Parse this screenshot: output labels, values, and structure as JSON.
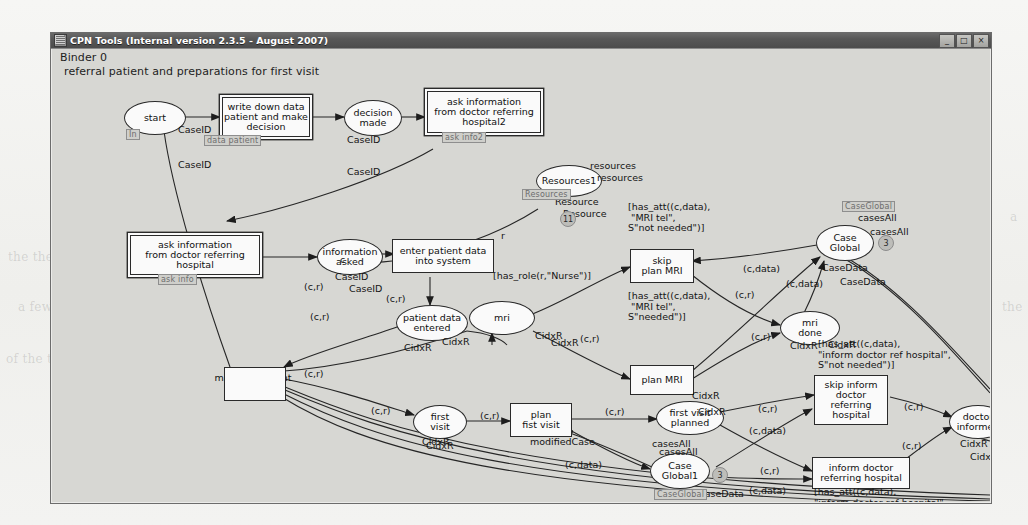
{
  "window": {
    "title": "CPN Tools (Internal version 2.3.5 - August 2007)",
    "icon": "cpn-app-icon",
    "buttons": {
      "minimize": "_",
      "maximize": "□",
      "close": "×"
    }
  },
  "canvas": {
    "binder_label": "Binder 0",
    "page_subtitle": "referral patient and preparations for first visit"
  },
  "ghost_text": [
    {
      "text": "the the and",
      "x": 8,
      "y": 250
    },
    {
      "text": "a few words",
      "x": 18,
      "y": 300
    },
    {
      "text": "of the to",
      "x": 6,
      "y": 352
    },
    {
      "text": "it is a and the in of it to a",
      "x": 130,
      "y": 466
    },
    {
      "text": "the and a to",
      "x": 470,
      "y": 468
    },
    {
      "text": "and the of a to in",
      "x": 700,
      "y": 470
    },
    {
      "text": "the",
      "x": 1002,
      "y": 300
    },
    {
      "text": "a",
      "x": 1010,
      "y": 210
    }
  ],
  "places": [
    {
      "id": "start",
      "label": "start",
      "type": "CaseID",
      "port": "In",
      "fusion": "",
      "marking": ""
    },
    {
      "id": "decision_made",
      "label": "decision\nmade",
      "type": "CaseID",
      "port": "",
      "fusion": "",
      "marking": ""
    },
    {
      "id": "information_asked",
      "label": "information\nasked",
      "type": "CaseID",
      "port": "",
      "fusion": "",
      "marking": ""
    },
    {
      "id": "patient_data",
      "label": "patient data\nentered",
      "type": "CidxR",
      "port": "",
      "fusion": "",
      "marking": ""
    },
    {
      "id": "resources1",
      "label": "Resources1",
      "type": "Resource",
      "port": "",
      "fusion": "Resources",
      "marking": "11",
      "name_label": "resources"
    },
    {
      "id": "mri",
      "label": "mri",
      "type": "CidxR",
      "port": "",
      "fusion": "",
      "marking": ""
    },
    {
      "id": "mri_done",
      "label": "mri\ndone",
      "type": "CidxR",
      "port": "",
      "fusion": "",
      "marking": ""
    },
    {
      "id": "case_global",
      "label": "Case\nGlobal",
      "type": "CaseData",
      "port": "",
      "fusion": "CaseGlobal",
      "marking": "3",
      "name_label": "casesAll"
    },
    {
      "id": "first_visit",
      "label": "first\nvisit",
      "type": "CidxR",
      "port": "",
      "fusion": "",
      "marking": ""
    },
    {
      "id": "first_visit_planned",
      "label": "first visit\nplanned",
      "type": "CidxR",
      "port": "",
      "fusion": "",
      "marking": ""
    },
    {
      "id": "case_global1",
      "label": "Case\nGlobal1",
      "type": "CaseData",
      "port": "",
      "fusion": "CaseGlobal",
      "marking": "3",
      "name_label": "casesAll"
    },
    {
      "id": "doctor_informed",
      "label": "doctor\ninformed",
      "type": "CidxR",
      "port": "",
      "fusion": "",
      "marking": ""
    }
  ],
  "transitions": [
    {
      "id": "write_down",
      "label": "write down data\npatient and make\ndecision",
      "tag": "data patient",
      "guard": ""
    },
    {
      "id": "ask_info2",
      "label": "ask information\nfrom doctor referring\nhospital2",
      "tag": "ask info2",
      "guard": ""
    },
    {
      "id": "ask_info",
      "label": "ask information\nfrom doctor referring\nhospital",
      "tag": "ask info",
      "guard": ""
    },
    {
      "id": "enter_patient",
      "label": "enter patient data\ninto system",
      "tag": "",
      "guard": "[has_role(r,\"Nurse\")]"
    },
    {
      "id": "skip_plan_mri",
      "label": "skip\nplan MRI",
      "tag": "",
      "guard": "[has_att((c,data),\n \"MRI tel\",\nS\"not needed\")]"
    },
    {
      "id": "plan_mri",
      "label": "plan MRI",
      "tag": "",
      "guard": "[has_att((c,data),\n \"MRI tel\",\nS\"needed\")]"
    },
    {
      "id": "make_document",
      "label": "make document\nand stickers",
      "tag": "",
      "guard": ""
    },
    {
      "id": "plan_fist_visit",
      "label": "plan\nfist visit",
      "tag": "",
      "guard": ""
    },
    {
      "id": "skip_inform",
      "label": "skip inform\ndoctor\nreferring\nhospital",
      "tag": "",
      "guard": "[has_att((c,data),\n\"inform doctor ref hospital\",\nS\"not needed\")]"
    },
    {
      "id": "inform_doctor",
      "label": "inform doctor\nreferring hospital",
      "tag": "",
      "guard": "[has_att((c,data),\n\"inform doctor ref hospital\",\nS\"needed\")]"
    }
  ],
  "arc_inscriptions": [
    {
      "text": "CaseID",
      "x": 126,
      "y": 111
    },
    {
      "text": "CaseID",
      "x": 295,
      "y": 118
    },
    {
      "text": "CaseID",
      "x": 297,
      "y": 235
    },
    {
      "text": "c",
      "x": 288,
      "y": 206
    },
    {
      "text": "(c,r)",
      "x": 334,
      "y": 245
    },
    {
      "text": "(c,r)",
      "x": 252,
      "y": 233
    },
    {
      "text": "r",
      "x": 449,
      "y": 182
    },
    {
      "text": "resources",
      "x": 545,
      "y": 124
    },
    {
      "text": "Resource",
      "x": 511,
      "y": 160
    },
    {
      "text": "CidxR",
      "x": 352,
      "y": 294
    },
    {
      "text": "CidxR",
      "x": 499,
      "y": 289
    },
    {
      "text": "(c,r)",
      "x": 528,
      "y": 285
    },
    {
      "text": "(c,r)",
      "x": 683,
      "y": 241
    },
    {
      "text": "(c,r)",
      "x": 699,
      "y": 283
    },
    {
      "text": "(c,data)",
      "x": 691,
      "y": 215
    },
    {
      "text": "(c,data)",
      "x": 734,
      "y": 230
    },
    {
      "text": "casesAll",
      "x": 818,
      "y": 178
    },
    {
      "text": "CaseData",
      "x": 788,
      "y": 228
    },
    {
      "text": "CidxR",
      "x": 776,
      "y": 291
    },
    {
      "text": "(c,r)",
      "x": 258,
      "y": 263
    },
    {
      "text": "(c,r)",
      "x": 252,
      "y": 320
    },
    {
      "text": "(c,r)",
      "x": 319,
      "y": 357
    },
    {
      "text": "(c,r)",
      "x": 428,
      "y": 362
    },
    {
      "text": "CidxR",
      "x": 374,
      "y": 392
    },
    {
      "text": "(c,r)",
      "x": 553,
      "y": 358
    },
    {
      "text": "modifiedCase",
      "x": 478,
      "y": 388
    },
    {
      "text": "(c,data)",
      "x": 513,
      "y": 411
    },
    {
      "text": "casesAll",
      "x": 607,
      "y": 398
    },
    {
      "text": "CaseData",
      "x": 653,
      "y": 452
    },
    {
      "text": "CidxR",
      "x": 646,
      "y": 358
    },
    {
      "text": "(c,r)",
      "x": 706,
      "y": 355
    },
    {
      "text": "(c,data)",
      "x": 697,
      "y": 377
    },
    {
      "text": "(c,r)",
      "x": 708,
      "y": 417
    },
    {
      "text": "(c,data)",
      "x": 697,
      "y": 437
    },
    {
      "text": "(c,r)",
      "x": 852,
      "y": 353
    },
    {
      "text": "(c,r)",
      "x": 850,
      "y": 392
    },
    {
      "text": "CidxR",
      "x": 918,
      "y": 403
    }
  ]
}
